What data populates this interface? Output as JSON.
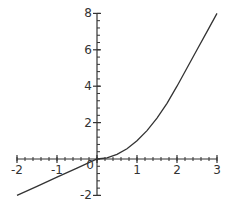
{
  "chart_data": {
    "type": "line",
    "title": "",
    "xlabel": "",
    "ylabel": "",
    "xlim": [
      -2,
      3
    ],
    "ylim": [
      -2,
      8
    ],
    "grid": false,
    "legend": null,
    "x_ticks": [
      -2,
      -1,
      0,
      1,
      2,
      3
    ],
    "x_tick_labels": [
      "-2",
      "-1",
      "0",
      "1",
      "2",
      "3"
    ],
    "y_ticks": [
      -2,
      2,
      4,
      6,
      8
    ],
    "y_tick_labels": [
      "-2",
      "2",
      "4",
      "6",
      "8"
    ],
    "minor_tick_step_x": 0.2,
    "minor_tick_step_y": 0.4,
    "series": [
      {
        "name": "f(x)",
        "color": "#333333",
        "description": "piecewise: linear y=x for x<0, quadratic for 0<=x<=2, nearly linear rising to 8 at x=3",
        "x": [
          -2,
          -1.5,
          -1,
          -0.5,
          0,
          0.25,
          0.5,
          0.75,
          1,
          1.25,
          1.5,
          1.75,
          2,
          2.25,
          2.5,
          2.75,
          3
        ],
        "y": [
          -2,
          -1.5,
          -1,
          -0.5,
          0,
          0.06,
          0.25,
          0.56,
          1,
          1.56,
          2.25,
          3.06,
          4,
          5,
          6,
          7,
          8
        ]
      }
    ]
  }
}
